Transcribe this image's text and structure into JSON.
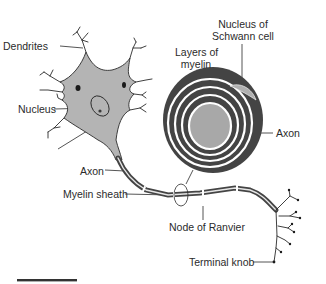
{
  "diagram": {
    "colors": {
      "cell_fill": "#b4b4b4",
      "outline": "#2a2a2a",
      "myelin_dark": "#444444",
      "myelin_light": "#ffffff",
      "axon_core": "#a8a8a8",
      "schwann_nucleus": "#b0b0b0",
      "text": "#2b2b2b"
    },
    "labels": {
      "dendrites": "Dendrites",
      "nucleus": "Nucleus",
      "cell_body": "Cell body",
      "axon_left": "Axon",
      "myelin_sheath": "Myelin sheath",
      "node_of_ranvier": "Node of Ranvier",
      "terminal_knob": "Terminal knob",
      "layers_of_myelin_line1": "Layers of",
      "layers_of_myelin_line2": "myelin",
      "nucleus_schwann_line1": "Nucleus of",
      "nucleus_schwann_line2": "Schwann cell",
      "axon_cross_section": "Axon"
    },
    "scale_bar": {
      "visible": true
    }
  }
}
